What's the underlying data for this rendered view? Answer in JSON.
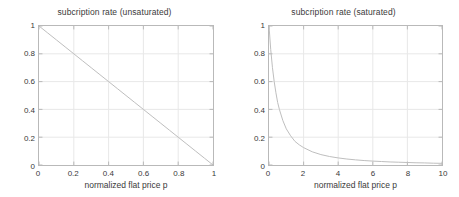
{
  "figure": {
    "background_color": "#ffffff",
    "axis_color": "#b9b9b9",
    "grid_color": "#e8e8e8",
    "curve_color": "#bdbdbd",
    "text_color": "#3a3a3a"
  },
  "chart_data": [
    {
      "type": "line",
      "panel": "left",
      "title": "subcription rate (unsaturated)",
      "xlabel": "normalized flat price p",
      "ylabel": "",
      "xlim": [
        0,
        1
      ],
      "ylim": [
        0,
        1
      ],
      "grid": true,
      "legend": "none",
      "xticks": [
        "0",
        "0.2",
        "0.4",
        "0.6",
        "0.8",
        "1"
      ],
      "xtick_values": [
        0,
        0.2,
        0.4,
        0.6,
        0.8,
        1
      ],
      "yticks": [
        "0",
        "0.2",
        "0.4",
        "0.6",
        "0.8",
        "1"
      ],
      "ytick_values": [
        0,
        0.2,
        0.4,
        0.6,
        0.8,
        1
      ],
      "series": [
        {
          "name": "subscription rate",
          "color": "#bdbdbd",
          "x": [
            0,
            0.05,
            0.1,
            0.15,
            0.2,
            0.25,
            0.3,
            0.35,
            0.4,
            0.45,
            0.5,
            0.55,
            0.6,
            0.65,
            0.7,
            0.75,
            0.8,
            0.85,
            0.9,
            0.95,
            1
          ],
          "y": [
            1,
            0.95,
            0.9,
            0.85,
            0.8,
            0.75,
            0.7,
            0.65,
            0.6,
            0.55,
            0.5,
            0.45,
            0.4,
            0.35,
            0.3,
            0.25,
            0.2,
            0.15,
            0.1,
            0.05,
            0
          ]
        }
      ]
    },
    {
      "type": "line",
      "panel": "right",
      "title": "subcription rate (saturated)",
      "xlabel": "normalized flat price p",
      "ylabel": "",
      "xlim": [
        0,
        10
      ],
      "ylim": [
        0,
        1
      ],
      "grid": true,
      "legend": "none",
      "xticks": [
        "0",
        "2",
        "4",
        "6",
        "8",
        "10"
      ],
      "xtick_values": [
        0,
        2,
        4,
        6,
        8,
        10
      ],
      "yticks": [
        "0",
        "0.2",
        "0.4",
        "0.6",
        "0.8",
        "1"
      ],
      "ytick_values": [
        0,
        0.2,
        0.4,
        0.6,
        0.8,
        1
      ],
      "series": [
        {
          "name": "subscription rate",
          "color": "#bdbdbd",
          "x": [
            0,
            0.1,
            0.2,
            0.3,
            0.4,
            0.5,
            0.6,
            0.8,
            1,
            1.25,
            1.5,
            1.75,
            2,
            2.5,
            3,
            3.5,
            4,
            4.5,
            5,
            5.5,
            6,
            6.5,
            7,
            7.5,
            8,
            8.5,
            9,
            9.5,
            10
          ],
          "y": [
            1,
            0.83,
            0.7,
            0.6,
            0.52,
            0.45,
            0.4,
            0.32,
            0.26,
            0.21,
            0.17,
            0.145,
            0.125,
            0.095,
            0.075,
            0.061,
            0.051,
            0.043,
            0.037,
            0.032,
            0.028,
            0.025,
            0.022,
            0.02,
            0.018,
            0.016,
            0.015,
            0.013,
            0.012
          ]
        }
      ]
    }
  ]
}
